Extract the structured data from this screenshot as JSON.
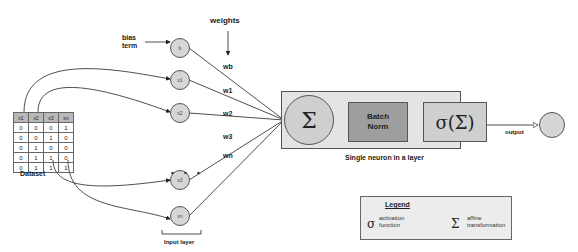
{
  "diagram": {
    "labels": {
      "bias_term": "bias\nterm",
      "weights": "weights",
      "dataset": "Dataset",
      "input_layer": "Input layer",
      "single_neuron": "Single neuron in a layer",
      "output": "output",
      "ellipsis": "• • •"
    },
    "nodes": {
      "bias": "b",
      "inputs": [
        "x1",
        "x2",
        "x3",
        "xn"
      ]
    },
    "weight_labels": [
      "wb",
      "w1",
      "w2",
      "w3",
      "wn"
    ],
    "neuron": {
      "sum_symbol": "Σ",
      "batch_norm": "Batch\nNorm",
      "activation": "σ(Σ)"
    },
    "dataset_table": {
      "headers": [
        "x1",
        "x2",
        "x3",
        "xn"
      ],
      "rows": [
        [
          "0",
          "0",
          "0",
          "1"
        ],
        [
          "0",
          "0",
          "1",
          "0"
        ],
        [
          "0",
          "1",
          "0",
          "0"
        ],
        [
          "0",
          "1",
          "1",
          "0"
        ],
        [
          "0",
          "1",
          "1",
          "1"
        ]
      ]
    },
    "legend": {
      "title": "Legend",
      "items": [
        {
          "symbol": "σ",
          "text": "activation\nfunction"
        },
        {
          "symbol": "Σ",
          "text": "affine\ntransformation"
        }
      ]
    },
    "colors": {
      "node_fill": "#d6d6d6",
      "neuron_box": "#e4e4e4",
      "batch_norm_fill": "#9e9e9e",
      "header_fill": "#b8b8b8"
    }
  }
}
